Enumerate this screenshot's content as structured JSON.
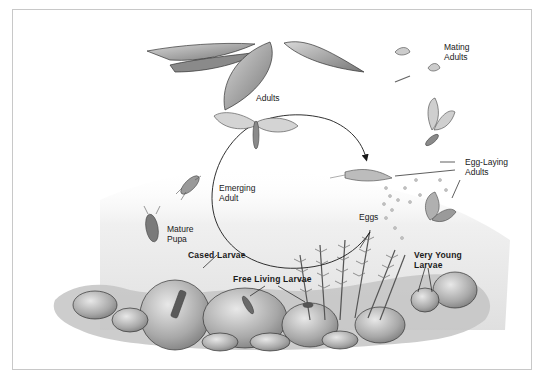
{
  "diagram": {
    "type": "life-cycle",
    "colors": {
      "background": "#ffffff",
      "frame": "#c8c8c8",
      "ink": "#1a1a1a",
      "wash_light": "#e6e6e6",
      "wash_mid": "#b8b8b8",
      "wash_dark": "#7a7a7a"
    },
    "labels": {
      "mating_adults_1": "Mating",
      "mating_adults_2": "Adults",
      "adults": "Adults",
      "egg_laying_1": "Egg-Laying",
      "egg_laying_2": "Adults",
      "emerging_1": "Emerging",
      "emerging_2": "Adult",
      "eggs": "Eggs",
      "mature_pupa_1": "Mature",
      "mature_pupa_2": "Pupa",
      "cased_larvae": "Cased Larvae",
      "free_living_larvae": "Free Living Larvae",
      "very_young_1": "Very Young",
      "very_young_2": "Larvae"
    },
    "cycle_order": [
      "Adults",
      "Egg-Laying Adults",
      "Eggs",
      "Very Young Larvae",
      "Free Living Larvae",
      "Cased Larvae",
      "Mature Pupa",
      "Emerging Adult"
    ]
  }
}
